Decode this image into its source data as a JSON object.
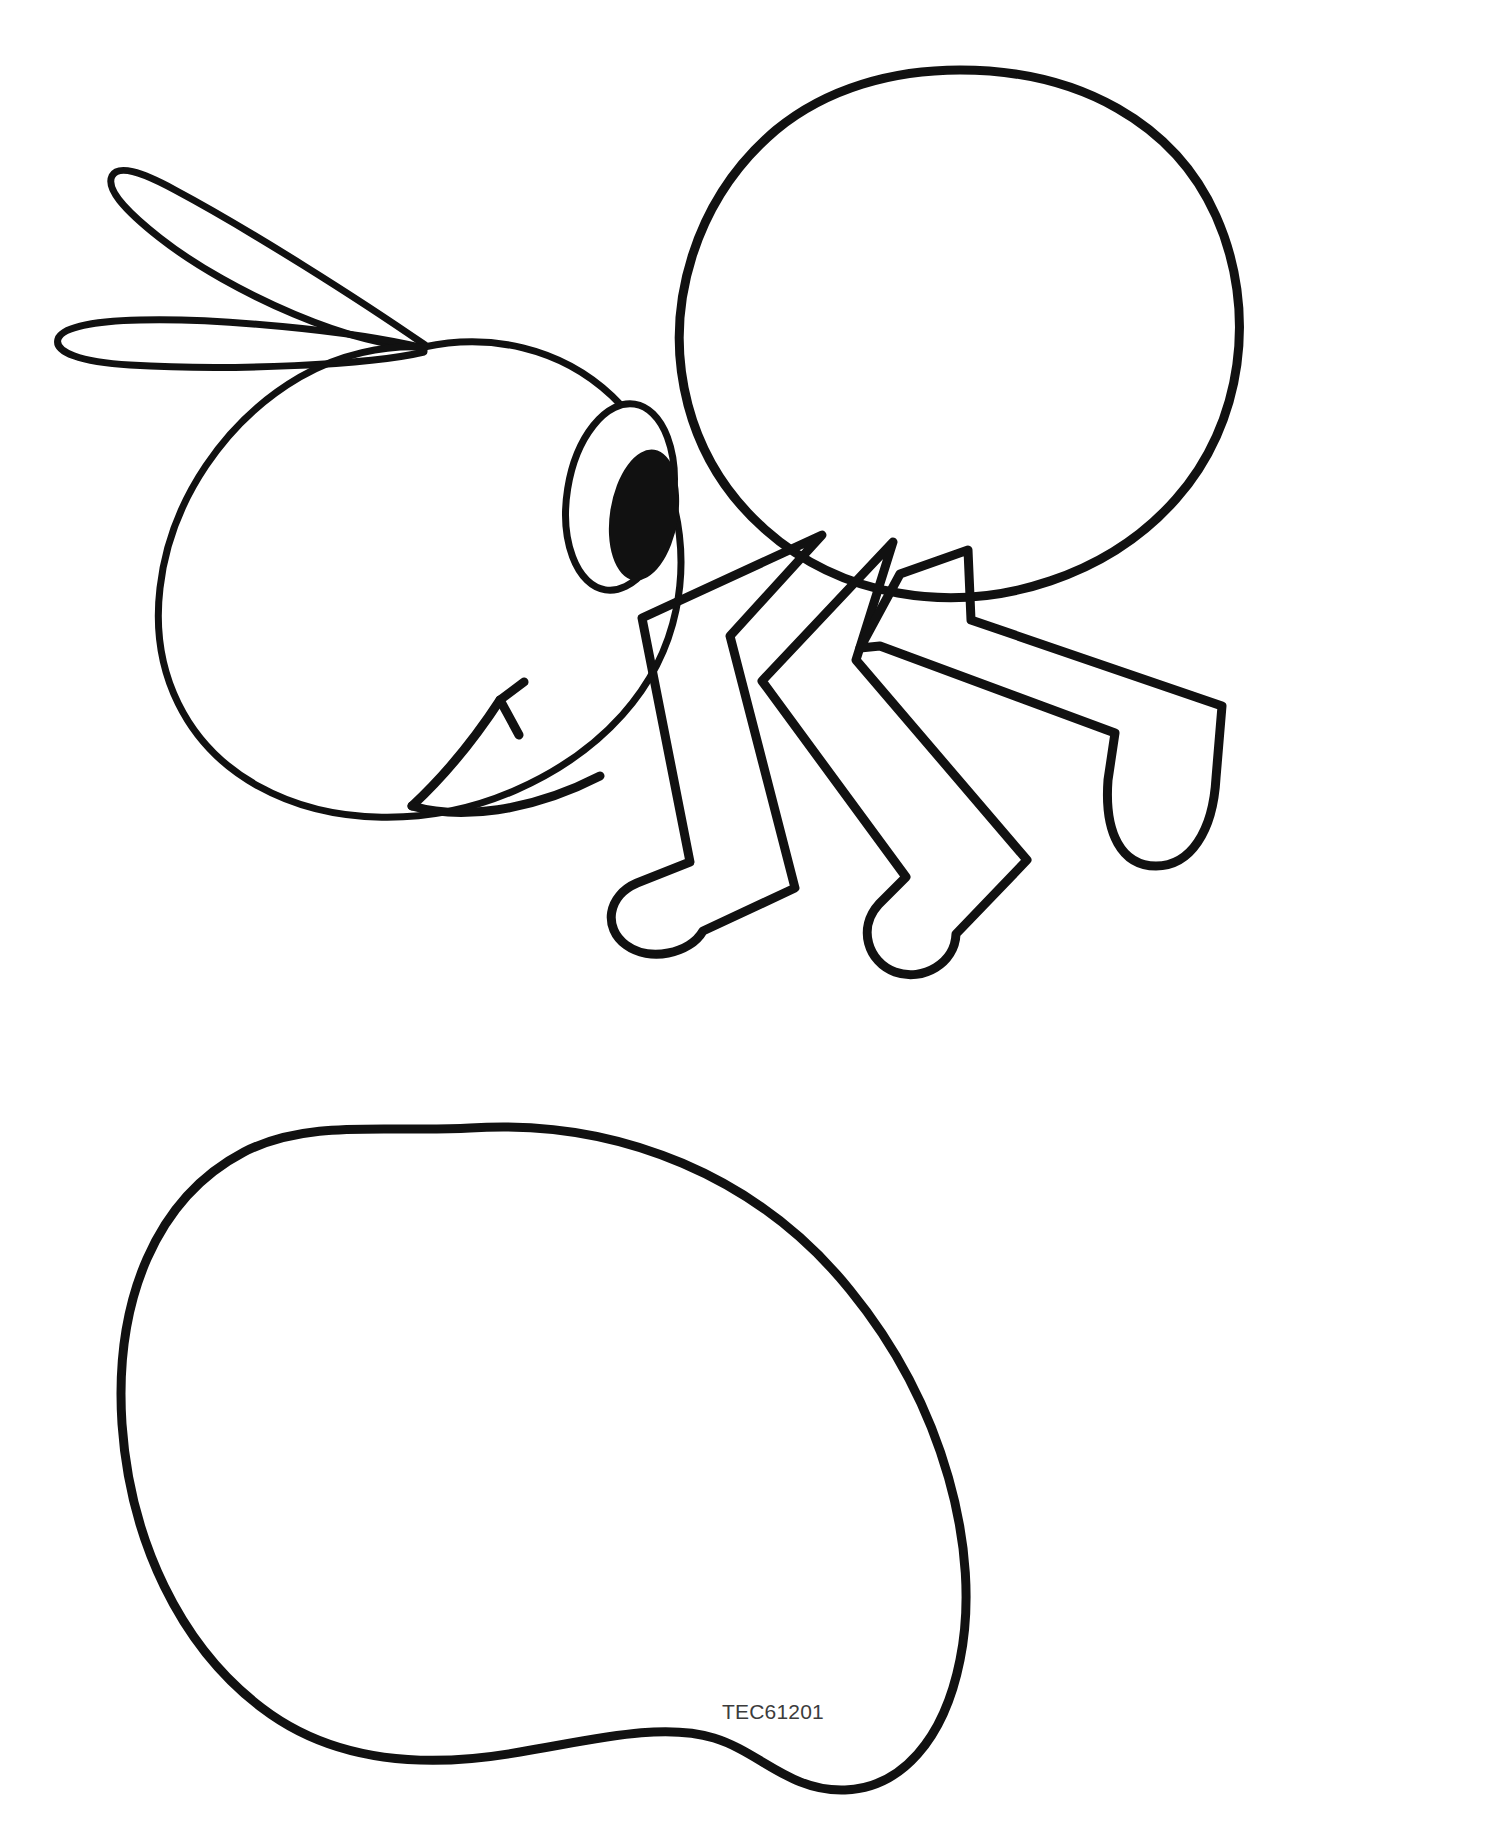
{
  "page": {
    "background_color": "#ffffff",
    "ink_color": "#111111",
    "width": 1494,
    "height": 1844
  },
  "header": {
    "clipped_text": "y  y     p g"
  },
  "watermark": {
    "code": "TEC61201"
  },
  "artwork": {
    "subject": "cartoon-ant-cut-out-template",
    "style": "black-line-art-on-white",
    "stroke_color": "#111111",
    "parts": [
      {
        "name": "antenna-upper",
        "label": "Upper Antenna"
      },
      {
        "name": "antenna-lower",
        "label": "Lower Antenna"
      },
      {
        "name": "head",
        "label": "Head"
      },
      {
        "name": "eye",
        "label": "Eye"
      },
      {
        "name": "pupil",
        "label": "Pupil"
      },
      {
        "name": "mouth",
        "label": "Smiling Mouth"
      },
      {
        "name": "thorax",
        "label": "Thorax"
      },
      {
        "name": "leg-front",
        "label": "Front Leg"
      },
      {
        "name": "leg-middle",
        "label": "Middle Leg"
      },
      {
        "name": "leg-rear",
        "label": "Rear Leg"
      },
      {
        "name": "abdomen",
        "label": "Abdomen"
      }
    ]
  }
}
